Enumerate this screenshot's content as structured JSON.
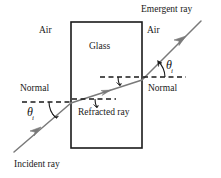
{
  "diagram": {
    "medium_left_label": "Air",
    "medium_right_label": "Air",
    "slab_label": "Glass",
    "normal_left_label": "Normal",
    "normal_right_label": "Normal",
    "incident_ray_label": "Incident ray",
    "refracted_ray_label": "Refracted ray",
    "emergent_ray_label": "Emergent ray",
    "angle_incidence_symbol": "θ",
    "angle_incidence_subscript": "i",
    "angle_emergence_symbol": "θ",
    "angle_emergence_subscript": "i",
    "colors": {
      "ray": "#7a7a7a",
      "slab_outline": "#1a1a1a",
      "normal_dash": "#1a1a1a",
      "text": "#1a1a1a",
      "background": "#ffffff"
    },
    "geometry": {
      "slab_x": 71,
      "slab_y": 22,
      "slab_width": 71,
      "slab_height": 126,
      "entry_point": [
        71,
        103
      ],
      "exit_point": [
        142,
        80
      ],
      "incident_start": [
        14,
        152
      ],
      "emergent_end": [
        201,
        21
      ]
    }
  }
}
